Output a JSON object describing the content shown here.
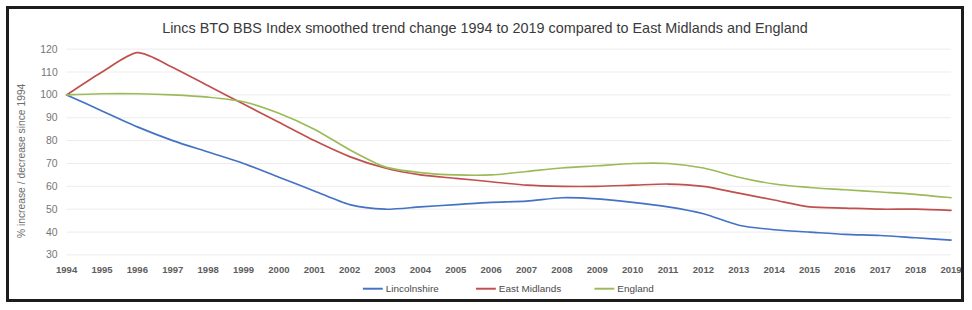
{
  "chart_data": {
    "type": "line",
    "title": "Lincs BTO BBS Index smoothed trend change 1994 to 2019 compared to East Midlands and England",
    "xlabel": "",
    "ylabel": "% increase / decrease since 1994",
    "ylim": [
      30,
      120
    ],
    "ytick_step": 10,
    "yticks": [
      120,
      110,
      100,
      90,
      80,
      70,
      60,
      50,
      40,
      30
    ],
    "grid": true,
    "legend_position": "bottom",
    "categories": [
      "1994",
      "1995",
      "1996",
      "1997",
      "1998",
      "1999",
      "2000",
      "2001",
      "2002",
      "2003",
      "2004",
      "2005",
      "2006",
      "2007",
      "2008",
      "2009",
      "2010",
      "2011",
      "2012",
      "2013",
      "2014",
      "2015",
      "2016",
      "2017",
      "2018",
      "2019"
    ],
    "series": [
      {
        "name": "Lincolnshire",
        "color": "#4472C4",
        "values": [
          100,
          93,
          86,
          80,
          75,
          70,
          64,
          58,
          52,
          50,
          51,
          52,
          53,
          53.5,
          55,
          54.5,
          53,
          51,
          48,
          43,
          41,
          40,
          39,
          38.5,
          37.5,
          36.5
        ]
      },
      {
        "name": "East Midlands",
        "color": "#C0504D",
        "values": [
          100,
          110,
          118.5,
          112,
          104,
          96,
          88,
          80,
          73,
          68,
          65,
          63.5,
          62,
          60.5,
          60,
          60,
          60.5,
          61,
          60,
          57,
          54,
          51,
          50.5,
          50,
          50,
          49.5
        ]
      },
      {
        "name": "England",
        "color": "#9BBB59",
        "values": [
          100,
          100.5,
          100.5,
          100,
          99,
          97,
          92,
          85,
          76,
          68.5,
          66,
          65,
          65,
          66.5,
          68,
          69,
          70,
          70,
          68,
          64,
          61,
          59.5,
          58.5,
          57.5,
          56.5,
          55
        ]
      }
    ]
  }
}
